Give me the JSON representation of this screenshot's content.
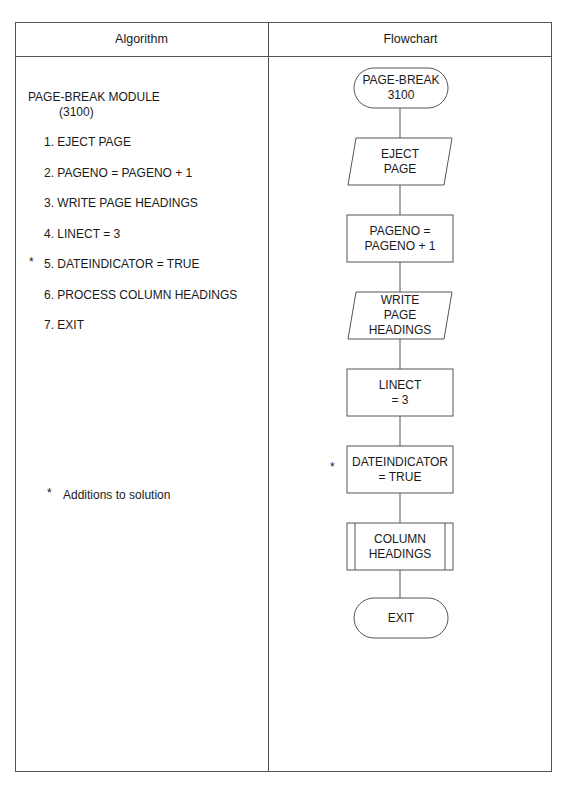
{
  "header": {
    "algorithm_label": "Algorithm",
    "flowchart_label": "Flowchart"
  },
  "algorithm": {
    "title": "PAGE-BREAK MODULE",
    "module_number": "(3100)",
    "steps": [
      {
        "text": "1. EJECT PAGE",
        "marked": false
      },
      {
        "text": "2. PAGENO = PAGENO + 1",
        "marked": false
      },
      {
        "text": "3. WRITE PAGE HEADINGS",
        "marked": false
      },
      {
        "text": "4. LINECT = 3",
        "marked": false
      },
      {
        "text": "5. DATEINDICATOR = TRUE",
        "marked": true
      },
      {
        "text": "6. PROCESS COLUMN HEADINGS",
        "marked": false
      },
      {
        "text": "7. EXIT",
        "marked": false
      }
    ],
    "marker": "*",
    "footnote_marker": "*",
    "footnote": "Additions to solution"
  },
  "flowchart": {
    "nodes": [
      {
        "id": "start",
        "shape": "terminal",
        "lines": [
          "PAGE-BREAK",
          "3100"
        ]
      },
      {
        "id": "eject",
        "shape": "input-output",
        "lines": [
          "EJECT",
          "PAGE"
        ]
      },
      {
        "id": "pageno",
        "shape": "process",
        "lines": [
          "PAGENO =",
          "PAGENO + 1"
        ]
      },
      {
        "id": "write",
        "shape": "input-output",
        "lines": [
          "WRITE",
          "PAGE",
          "HEADINGS"
        ]
      },
      {
        "id": "linect",
        "shape": "process",
        "lines": [
          "LINECT",
          "= 3"
        ]
      },
      {
        "id": "dateind",
        "shape": "process",
        "lines": [
          "DATEINDICATOR",
          "= TRUE"
        ],
        "marked": true
      },
      {
        "id": "colhead",
        "shape": "predefined-process",
        "lines": [
          "COLUMN",
          "HEADINGS"
        ]
      },
      {
        "id": "exit",
        "shape": "terminal",
        "lines": [
          "EXIT"
        ]
      }
    ],
    "marker": "*",
    "line_color": "#555555"
  }
}
